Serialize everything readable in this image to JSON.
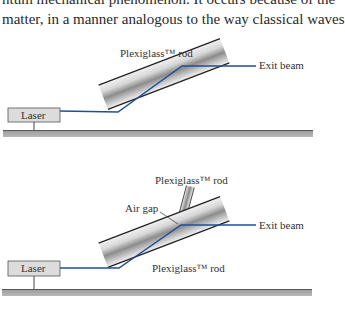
{
  "body_text": {
    "line1": "ntum mechanical phenomenon. It occurs because of the",
    "line2": "matter, in a manner analogous to the way classical waves"
  },
  "figure_top": {
    "rod_label": "Plexiglass™ rod",
    "exit_label": "Exit beam",
    "laser_label": "Laser"
  },
  "figure_bottom": {
    "upper_rod_label": "Plexiglass™ rod",
    "air_gap_label": "Air gap",
    "exit_label": "Exit beam",
    "lower_rod_label": "Plexiglass™ rod",
    "laser_label": "Laser"
  },
  "colors": {
    "beam": "#1f4e9a",
    "ground": "#a9a9a9",
    "laser_box": "#dcdcdc",
    "rod_edge": "#222222"
  }
}
